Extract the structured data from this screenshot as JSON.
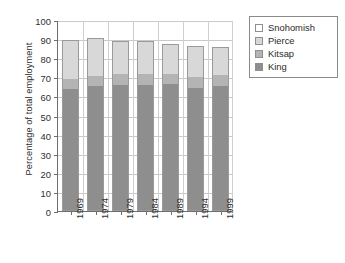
{
  "chart_data": {
    "type": "bar",
    "title": "",
    "xlabel": "",
    "ylabel": "Percentage of total employment",
    "ylim": [
      0,
      100
    ],
    "ytick_step": 10,
    "yticks": [
      0,
      10,
      20,
      30,
      40,
      50,
      60,
      70,
      80,
      90,
      100
    ],
    "grid": true,
    "stacked": true,
    "legend_position": "top-right",
    "categories": [
      "1969",
      "1974",
      "1979",
      "1984",
      "1989",
      "1994",
      "1999"
    ],
    "series": [
      {
        "name": "King",
        "color": "#8e8e8e",
        "values": [
          63.8,
          65.6,
          66.2,
          65.8,
          66.3,
          64.6,
          65.7
        ]
      },
      {
        "name": "Kitsap",
        "color": "#b4b4b4",
        "values": [
          5.2,
          5.3,
          5.6,
          6.0,
          5.5,
          5.6,
          5.6
        ]
      },
      {
        "name": "Pierce",
        "color": "#d8d8d8",
        "values": [
          20.5,
          19.6,
          17.1,
          17.1,
          15.7,
          16.3,
          14.7
        ]
      },
      {
        "name": "Snohomish",
        "color": "#ffffff",
        "values": [
          10.5,
          9.5,
          11.1,
          11.1,
          12.5,
          13.5,
          14.0
        ]
      }
    ],
    "stack_tops": {
      "King": [
        63.8,
        65.6,
        66.2,
        65.8,
        66.3,
        64.6,
        65.7
      ],
      "Kitsap": [
        69.0,
        70.9,
        71.8,
        71.8,
        71.8,
        70.2,
        71.3
      ],
      "Pierce": [
        89.5,
        90.5,
        88.9,
        88.9,
        87.5,
        86.5,
        86.0
      ]
    }
  },
  "legend": {
    "items": [
      {
        "label": "Snohomish",
        "swatch": "sw-snohomish"
      },
      {
        "label": "Pierce",
        "swatch": "sw-pierce"
      },
      {
        "label": "Kitsap",
        "swatch": "sw-kitsap"
      },
      {
        "label": "King",
        "swatch": "sw-king"
      }
    ]
  }
}
